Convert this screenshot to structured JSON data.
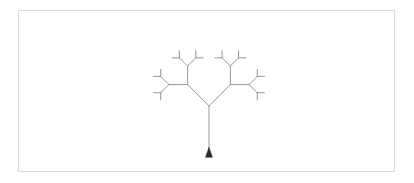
{
  "app": {
    "title": "Turtle Graphics Fractal Tree",
    "canvas_label": "drawing-canvas"
  },
  "canvas": {
    "background_color": "#ffffff",
    "border_color": "#d8d8d8",
    "border_width": 1,
    "x": 18,
    "y": 10,
    "width": 377,
    "height": 162
  },
  "drawing": {
    "name": "fractal-binary-tree",
    "stroke_color": "#8a8a8a",
    "stroke_width": 0.9,
    "origin_x": 209,
    "origin_y": 155,
    "trunk_length": 49,
    "branch_angle_degrees": 45,
    "length_ratio": 0.62,
    "recursion_depth": 4,
    "initial_heading_degrees": 90
  },
  "turtle": {
    "name": "turtle-cursor",
    "shape": "triangle",
    "color": "#2b2b2b",
    "x": 209,
    "y": 155,
    "heading_degrees": 90,
    "size": 7
  }
}
